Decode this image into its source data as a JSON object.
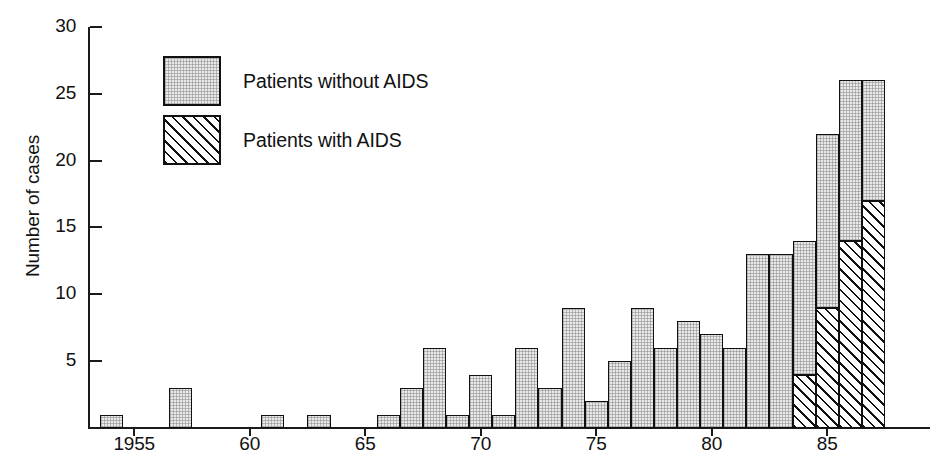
{
  "chart_data": {
    "type": "bar",
    "title": "",
    "subtitle": "",
    "xlabel": "",
    "ylabel": "Number of cases",
    "stacked": true,
    "grid": false,
    "legend_position": "inside-top-left",
    "xlim": [
      1953.5,
      1988
    ],
    "ylim": [
      0,
      30
    ],
    "y_ticks": [
      0,
      5,
      10,
      15,
      20,
      25,
      30
    ],
    "y_tick_labels": [
      "",
      "5",
      "10",
      "15",
      "20",
      "25",
      "30"
    ],
    "x_ticks": [
      1955,
      1960,
      1965,
      1970,
      1975,
      1980,
      1985
    ],
    "x_tick_labels": [
      "1955",
      "60",
      "65",
      "70",
      "75",
      "80",
      "85"
    ],
    "categories": [
      1954,
      1955,
      1956,
      1957,
      1958,
      1959,
      1960,
      1961,
      1962,
      1963,
      1964,
      1965,
      1966,
      1967,
      1968,
      1969,
      1970,
      1971,
      1972,
      1973,
      1974,
      1975,
      1976,
      1977,
      1978,
      1979,
      1980,
      1981,
      1982,
      1983,
      1984,
      1985,
      1986,
      1987
    ],
    "series": [
      {
        "name": "Patients without AIDS",
        "values": [
          1,
          0,
          0,
          3,
          0,
          0,
          0,
          1,
          0,
          1,
          0,
          0,
          1,
          3,
          6,
          1,
          4,
          1,
          6,
          3,
          9,
          2,
          5,
          9,
          6,
          8,
          7,
          6,
          13,
          13,
          10,
          13,
          12,
          9
        ]
      },
      {
        "name": "Patients with AIDS",
        "values": [
          0,
          0,
          0,
          0,
          0,
          0,
          0,
          0,
          0,
          0,
          0,
          0,
          0,
          0,
          0,
          0,
          0,
          0,
          0,
          0,
          0,
          0,
          0,
          0,
          0,
          0,
          0,
          0,
          0,
          0,
          4,
          9,
          14,
          17
        ]
      }
    ],
    "totals": [
      1,
      0,
      0,
      3,
      0,
      0,
      0,
      1,
      0,
      1,
      0,
      0,
      1,
      3,
      6,
      1,
      4,
      1,
      6,
      3,
      9,
      2,
      5,
      9,
      6,
      8,
      7,
      6,
      13,
      13,
      14,
      22,
      26,
      26
    ]
  },
  "legend": {
    "items": [
      {
        "label": "Patients without AIDS",
        "swatch": "plain-fill-swatch"
      },
      {
        "label": "Patients with AIDS",
        "swatch": "diagonal-hatch-swatch"
      }
    ]
  },
  "colors": {
    "ink": "#111111",
    "plain_fill": "#e9e9e9",
    "hatch_fill": "#ffffff",
    "background": "#ffffff"
  }
}
